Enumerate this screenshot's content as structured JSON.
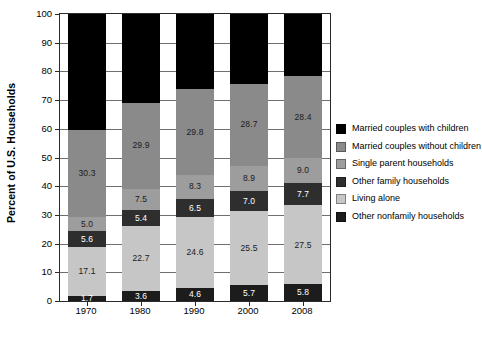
{
  "chart_data": {
    "type": "bar",
    "subtype": "stacked-bar-100",
    "title": "",
    "xlabel": "",
    "ylabel": "Percent of U.S. Households",
    "ylim": [
      0,
      100
    ],
    "ytick_step": 10,
    "yticks": [
      "0",
      "10",
      "20",
      "30",
      "40",
      "50",
      "60",
      "70",
      "80",
      "90",
      "100"
    ],
    "grid": true,
    "legend_position": "right",
    "categories": [
      "1970",
      "1980",
      "1990",
      "2000",
      "2008"
    ],
    "series": [
      {
        "name": "Other nonfamily households",
        "color": "#1c1c1c",
        "text_color": "light",
        "values": [
          1.7,
          3.6,
          4.6,
          5.7,
          5.8
        ],
        "labels": [
          "1.7",
          "3.6",
          "4.6",
          "5.7",
          "5.8"
        ]
      },
      {
        "name": "Living alone",
        "color": "#c6c6c6",
        "text_color": "dark",
        "values": [
          17.1,
          22.7,
          24.6,
          25.5,
          27.5
        ],
        "labels": [
          "17.1",
          "22.7",
          "24.6",
          "25.5",
          "27.5"
        ]
      },
      {
        "name": "Other family households",
        "color": "#2e2e2e",
        "text_color": "light",
        "values": [
          5.6,
          5.4,
          6.5,
          7.0,
          7.7
        ],
        "labels": [
          "5.6",
          "5.4",
          "6.5",
          "7.0",
          "7.7"
        ]
      },
      {
        "name": "Single parent households",
        "color": "#9d9d9d",
        "text_color": "dark",
        "values": [
          5.0,
          7.5,
          8.3,
          8.9,
          9.0
        ],
        "labels": [
          "5.0",
          "7.5",
          "8.3",
          "8.9",
          "9.0"
        ]
      },
      {
        "name": "Married couples without children",
        "color": "#8a8a8a",
        "text_color": "dark",
        "values": [
          30.3,
          29.9,
          29.8,
          28.7,
          28.4
        ],
        "labels": [
          "30.3",
          "29.9",
          "29.8",
          "28.7",
          "28.4"
        ]
      },
      {
        "name": "Married couples with children",
        "color": "#000000",
        "text_color": "light",
        "values": [
          40.3,
          30.9,
          26.2,
          24.2,
          21.6
        ],
        "labels": [
          "",
          "",
          "",
          "",
          ""
        ]
      }
    ]
  },
  "legend": {
    "items": [
      {
        "label": "Married couples with children",
        "color": "#000000"
      },
      {
        "label": "Married couples without children",
        "color": "#8a8a8a"
      },
      {
        "label": "Single parent households",
        "color": "#9d9d9d"
      },
      {
        "label": "Other family households",
        "color": "#2e2e2e"
      },
      {
        "label": "Living alone",
        "color": "#c6c6c6"
      },
      {
        "label": "Other nonfamily households",
        "color": "#1c1c1c"
      }
    ]
  }
}
